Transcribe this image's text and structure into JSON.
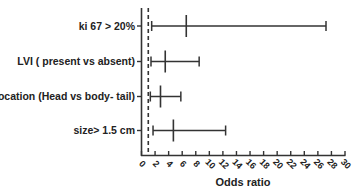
{
  "chart_data": {
    "type": "forest",
    "title": "",
    "xlabel": "Odds ratio",
    "ylabel": "",
    "xlim": [
      0,
      30
    ],
    "x_ticks": [
      0,
      2,
      4,
      6,
      8,
      10,
      12,
      14,
      16,
      18,
      20,
      22,
      24,
      26,
      28,
      30
    ],
    "x_tick_labels": [
      "0",
      "2",
      "4",
      "6",
      "8",
      "10",
      "12",
      "14",
      "16",
      "18",
      "20",
      "22",
      "24",
      "26",
      "28",
      "30"
    ],
    "reference_line": 1,
    "grid": false,
    "legend": null,
    "categories": [
      "ki 67 > 20%",
      "LVI ( present vs absent)",
      "location (Head vs body- tail)",
      "size> 1.5 cm"
    ],
    "series": [
      {
        "name": "Odds ratio (95% CI)",
        "point": [
          6.6,
          3.5,
          2.8,
          4.7
        ],
        "lower": [
          1.5,
          1.4,
          1.3,
          1.7
        ],
        "upper": [
          27.2,
          8.5,
          5.8,
          12.4
        ]
      }
    ]
  },
  "colors": {
    "line": "#333333",
    "text": "#222222",
    "background": "#ffffff"
  }
}
